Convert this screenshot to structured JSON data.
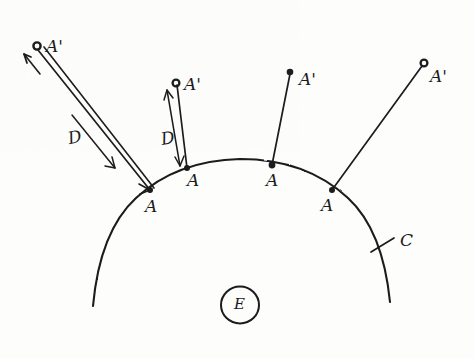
{
  "diagram": {
    "ink_color": "#1b1b1b",
    "background_color": "#fdfdfc",
    "curve": {
      "label": "C",
      "label_position": {
        "x": 403,
        "y": 243
      },
      "leader_line": {
        "x1": 371,
        "y1": 252,
        "x2": 394,
        "y2": 238
      }
    },
    "interior_marker": {
      "label": "E",
      "center": {
        "x": 240,
        "y": 305
      },
      "radius": 19
    },
    "points": [
      {
        "id": "pair-1",
        "base_label": "A",
        "base_label_position": {
          "x": 148,
          "y": 209
        },
        "base_point": {
          "x": 150,
          "y": 190
        },
        "tip_label": "A'",
        "tip_label_position": {
          "x": 46,
          "y": 50
        },
        "tip_point": {
          "x": 37,
          "y": 46
        },
        "tip_marker": "open-circle",
        "distance_label": "D",
        "distance_label_position": {
          "x": 73,
          "y": 146
        },
        "has_distance_arrow": true,
        "arrow_style": "double-line-with-arrowhead"
      },
      {
        "id": "pair-2",
        "base_label": "A",
        "base_label_position": {
          "x": 190,
          "y": 184
        },
        "base_point": {
          "x": 187,
          "y": 168
        },
        "tip_label": "A'",
        "tip_label_position": {
          "x": 184,
          "y": 89
        },
        "tip_point": {
          "x": 176,
          "y": 83
        },
        "tip_marker": "open-circle",
        "distance_label": "D",
        "distance_label_position": {
          "x": 166,
          "y": 144
        },
        "has_distance_arrow": true,
        "arrow_style": "double-headed-arrow"
      },
      {
        "id": "pair-3",
        "base_label": "A",
        "base_label_position": {
          "x": 269,
          "y": 183
        },
        "base_point": {
          "x": 272,
          "y": 165
        },
        "tip_label": "A'",
        "tip_label_position": {
          "x": 300,
          "y": 83
        },
        "tip_point": {
          "x": 290,
          "y": 72
        },
        "tip_marker": "filled-dot",
        "distance_label": null,
        "has_distance_arrow": false,
        "arrow_style": "plain-line"
      },
      {
        "id": "pair-4",
        "base_label": "A",
        "base_label_position": {
          "x": 324,
          "y": 208
        },
        "base_point": {
          "x": 332,
          "y": 190
        },
        "tip_label": "A'",
        "tip_label_position": {
          "x": 432,
          "y": 80
        },
        "tip_point": {
          "x": 424,
          "y": 63
        },
        "tip_marker": "open-circle",
        "distance_label": null,
        "has_distance_arrow": false,
        "arrow_style": "plain-line"
      }
    ]
  }
}
